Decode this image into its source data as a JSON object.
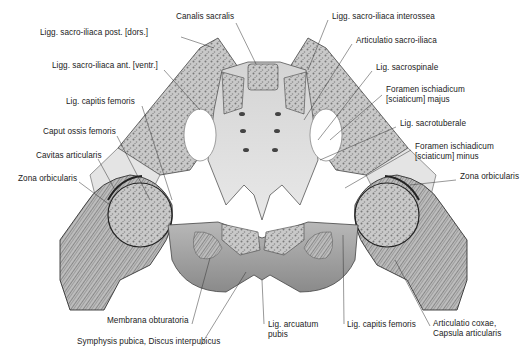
{
  "figure": {
    "colors": {
      "background": "#ffffff",
      "bone": "#d8d8d8",
      "spongy": "#9a9a9a",
      "line": "#333333",
      "text": "#222222"
    }
  },
  "labels": {
    "left": [
      {
        "text": "Ligg. sacro-iliaca post. [dors.]",
        "x": 40,
        "y": 32
      },
      {
        "text": "Ligg. sacro-iliaca ant. [ventr.]",
        "x": 52,
        "y": 65
      },
      {
        "text": "Lig. capitis femoris",
        "x": 66,
        "y": 101
      },
      {
        "text": "Caput ossis femoris",
        "x": 43,
        "y": 131
      },
      {
        "text": "Cavitas articularis",
        "x": 36,
        "y": 155
      },
      {
        "text": "Zona orbicularis",
        "x": 18,
        "y": 178
      }
    ],
    "top": [
      {
        "text": "Canalis sacralis",
        "x": 176,
        "y": 16
      }
    ],
    "right": [
      {
        "text": "Ligg. sacro-iliaca interossea",
        "x": 332,
        "y": 16
      },
      {
        "text": "Articulatio sacro-iliaca",
        "x": 356,
        "y": 40
      },
      {
        "text": "Lig. sacrospinale",
        "x": 376,
        "y": 67
      },
      {
        "text_lines": [
          "Foramen ischiadicum",
          "[sciaticum]  majus"
        ],
        "x": 386,
        "y": 88
      },
      {
        "text": "Lig. sacrotuberale",
        "x": 400,
        "y": 123
      },
      {
        "text_lines": [
          "Foramen ischiadicum",
          "[sciaticum]  minus"
        ],
        "x": 415,
        "y": 145
      },
      {
        "text": "Zona orbicularis",
        "x": 460,
        "y": 176
      }
    ],
    "bottom": [
      {
        "text": "Membrana obturatoria",
        "x": 107,
        "y": 320
      },
      {
        "text": "Symphysis pubica, Discus interpubicus",
        "x": 77,
        "y": 341
      },
      {
        "text_lines": [
          "Lig.  arcuatum",
          "pubis"
        ],
        "x": 268,
        "y": 323
      },
      {
        "text": "Lig.  capitis femoris",
        "x": 347,
        "y": 323
      },
      {
        "text_lines": [
          "Articulatio  coxae,",
          "Capsula articularis"
        ],
        "x": 433,
        "y": 322
      }
    ]
  }
}
